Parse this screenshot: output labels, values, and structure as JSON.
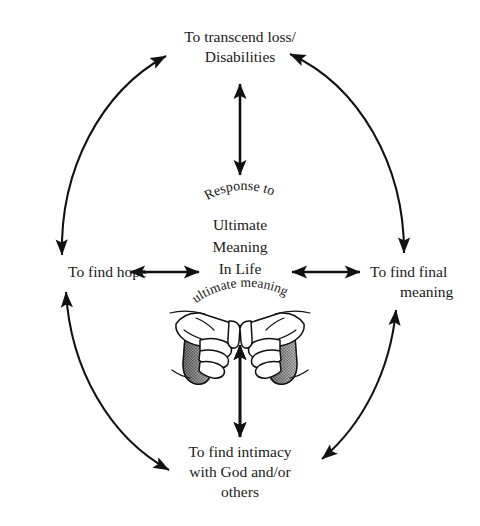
{
  "diagram": {
    "title": "Response to Ultimate Meaning In Life",
    "type": "cycle-diagram",
    "background_color": "#ffffff",
    "line_color": "#111111",
    "text_color": "#1a1a1a"
  },
  "center": {
    "curved_top_text": "Response to",
    "lines": [
      "Ultimate",
      "Meaning",
      "In Life"
    ],
    "curved_bottom_text": "ultimate meaning",
    "illustration_name": "cupped-hands"
  },
  "nodes": {
    "top": {
      "name": "to-transcend-loss-disabilities",
      "lines": [
        "To transcend loss/",
        "Disabilities"
      ]
    },
    "left": {
      "name": "to-find-hope",
      "lines": [
        "To find hope"
      ]
    },
    "right": {
      "name": "to-find-final-meaning",
      "lines": [
        "To find final",
        "meaning"
      ]
    },
    "bottom": {
      "name": "to-find-intimacy-with-god",
      "lines": [
        "To find intimacy",
        "with God and/or",
        "others"
      ]
    }
  },
  "connectors": [
    {
      "name": "arc-hope-to-transcend",
      "style": "curved",
      "heads": "double"
    },
    {
      "name": "arc-transcend-to-final-meaning",
      "style": "curved",
      "heads": "double"
    },
    {
      "name": "arc-final-meaning-to-intimacy",
      "style": "curved",
      "heads": "double"
    },
    {
      "name": "arc-intimacy-to-hope",
      "style": "curved",
      "heads": "double"
    },
    {
      "name": "arrow-center-to-top",
      "style": "straight-vertical",
      "heads": "double"
    },
    {
      "name": "arrow-center-to-bottom",
      "style": "straight-vertical",
      "heads": "double"
    },
    {
      "name": "arrow-center-to-left",
      "style": "straight-horizontal",
      "heads": "double"
    },
    {
      "name": "arrow-center-to-right",
      "style": "straight-horizontal",
      "heads": "double"
    }
  ]
}
